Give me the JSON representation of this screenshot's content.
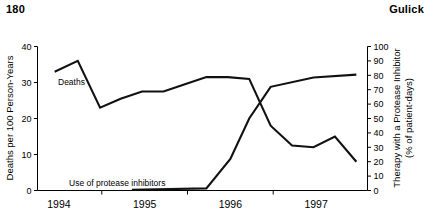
{
  "page": {
    "number": "180",
    "author": "Gulick"
  },
  "chart_data": {
    "type": "line",
    "title": "",
    "xlabel": "",
    "ylabel": "Deaths per 100 Person-Years",
    "y2label": "Therapy with a Protease Inhibitor\n(% of patient-days)",
    "ylabel_line1": "Deaths per 100 Person-Years",
    "y2label_line1": "Therapy with a Protease Inhibitor",
    "y2label_line2": "(% of patient-days)",
    "grid": false,
    "legend": "inline-annotations",
    "xlim": [
      1993.75,
      1997.6
    ],
    "ylim": [
      0,
      40
    ],
    "y2lim": [
      0,
      100
    ],
    "yticks": [
      "0",
      "10",
      "20",
      "30",
      "40"
    ],
    "ytick_values": [
      0,
      10,
      20,
      30,
      40
    ],
    "y2ticks": [
      "0",
      "10",
      "20",
      "30",
      "40",
      "50",
      "60",
      "70",
      "80",
      "90",
      "100"
    ],
    "y2tick_values": [
      0,
      10,
      20,
      30,
      40,
      50,
      60,
      70,
      80,
      90,
      100
    ],
    "xticks": [
      "1994",
      "1995",
      "1996",
      "1997"
    ],
    "xtick_label_positions": [
      1994.0,
      1995.0,
      1996.0,
      1997.0
    ],
    "xtick_mark_positions": [
      1994.5,
      1995.5,
      1996.5
    ],
    "series": [
      {
        "name": "Deaths",
        "annotation": "Deaths",
        "axis": "left",
        "units": "deaths per 100 person-years",
        "x": [
          1993.95,
          1994.22,
          1994.48,
          1994.72,
          1994.97,
          1995.22,
          1995.47,
          1995.72,
          1995.97,
          1996.22,
          1996.47,
          1996.72,
          1996.97,
          1997.22,
          1997.47
        ],
        "values": [
          33.0,
          36.0,
          23.0,
          25.5,
          27.5,
          27.5,
          29.5,
          31.5,
          31.5,
          31.0,
          18.0,
          12.5,
          12.0,
          15.0,
          8.0
        ]
      },
      {
        "name": "Use of protease inhibitors",
        "annotation": "Use of protease inhibitors",
        "axis": "right",
        "units": "% of patient-days",
        "x": [
          1994.85,
          1995.72,
          1996.0,
          1996.22,
          1996.47,
          1996.97,
          1997.47
        ],
        "values": [
          0.5,
          1.5,
          22.0,
          50.0,
          72.0,
          78.5,
          80.5
        ]
      }
    ]
  }
}
